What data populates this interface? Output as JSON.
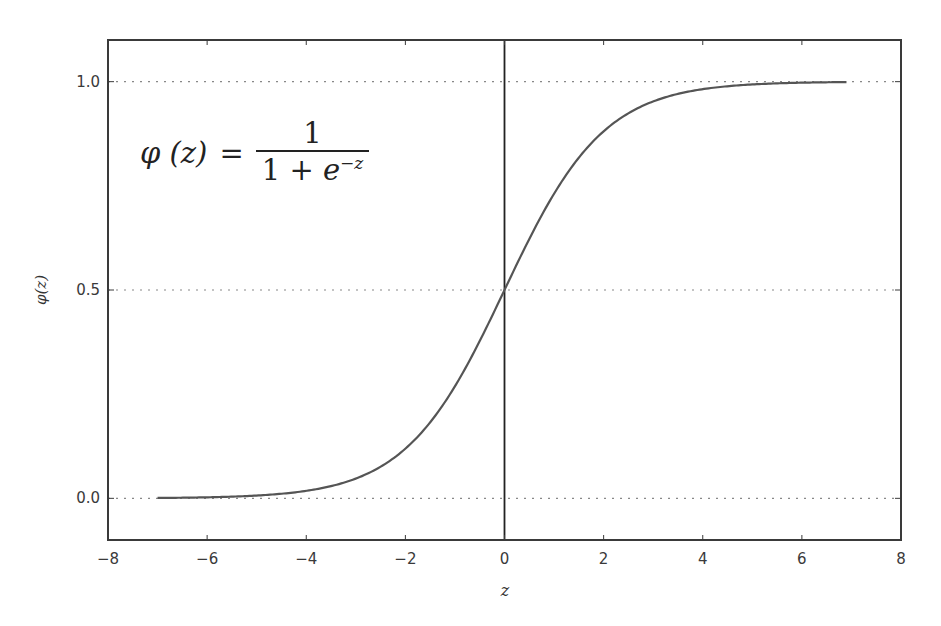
{
  "chart_data": {
    "type": "line",
    "title": "",
    "xlabel": "z",
    "ylabel": "φ(z)",
    "xlim": [
      -8,
      8
    ],
    "ylim": [
      -0.1,
      1.1
    ],
    "xticks": [
      -8,
      -6,
      -4,
      -2,
      0,
      2,
      4,
      6,
      8
    ],
    "xtick_labels": [
      "−8",
      "−6",
      "−4",
      "−2",
      "0",
      "2",
      "4",
      "6",
      "8"
    ],
    "yticks": [
      0.0,
      0.5,
      1.0
    ],
    "ytick_labels": [
      "0.0",
      "0.5",
      "1.0"
    ],
    "grid": "horizontal dotted at y ticks",
    "vertical_reference_line": 0,
    "series": [
      {
        "name": "sigmoid",
        "function": "1/(1+exp(-z))",
        "x": [
          -7,
          -6,
          -5,
          -4,
          -3,
          -2,
          -1,
          0,
          1,
          2,
          3,
          4,
          5,
          6,
          6.9
        ],
        "values": [
          0.001,
          0.002,
          0.007,
          0.018,
          0.047,
          0.119,
          0.269,
          0.5,
          0.731,
          0.881,
          0.953,
          0.982,
          0.993,
          0.998,
          0.999
        ],
        "color": "#555555"
      }
    ],
    "annotations": [
      {
        "text": "φ (z) = 1 / (1 + e^−z)",
        "position": "upper-left"
      }
    ],
    "legend": "none"
  },
  "formula": {
    "lhs": "φ (z)",
    "eq": "=",
    "numerator": "1",
    "denominator_prefix": "1 + ",
    "denominator_base": "e",
    "denominator_exp": "−z"
  },
  "colors": {
    "frame": "#3a3a3a",
    "curve": "#555555",
    "grid": "#888888",
    "zero_line": "#222222"
  }
}
